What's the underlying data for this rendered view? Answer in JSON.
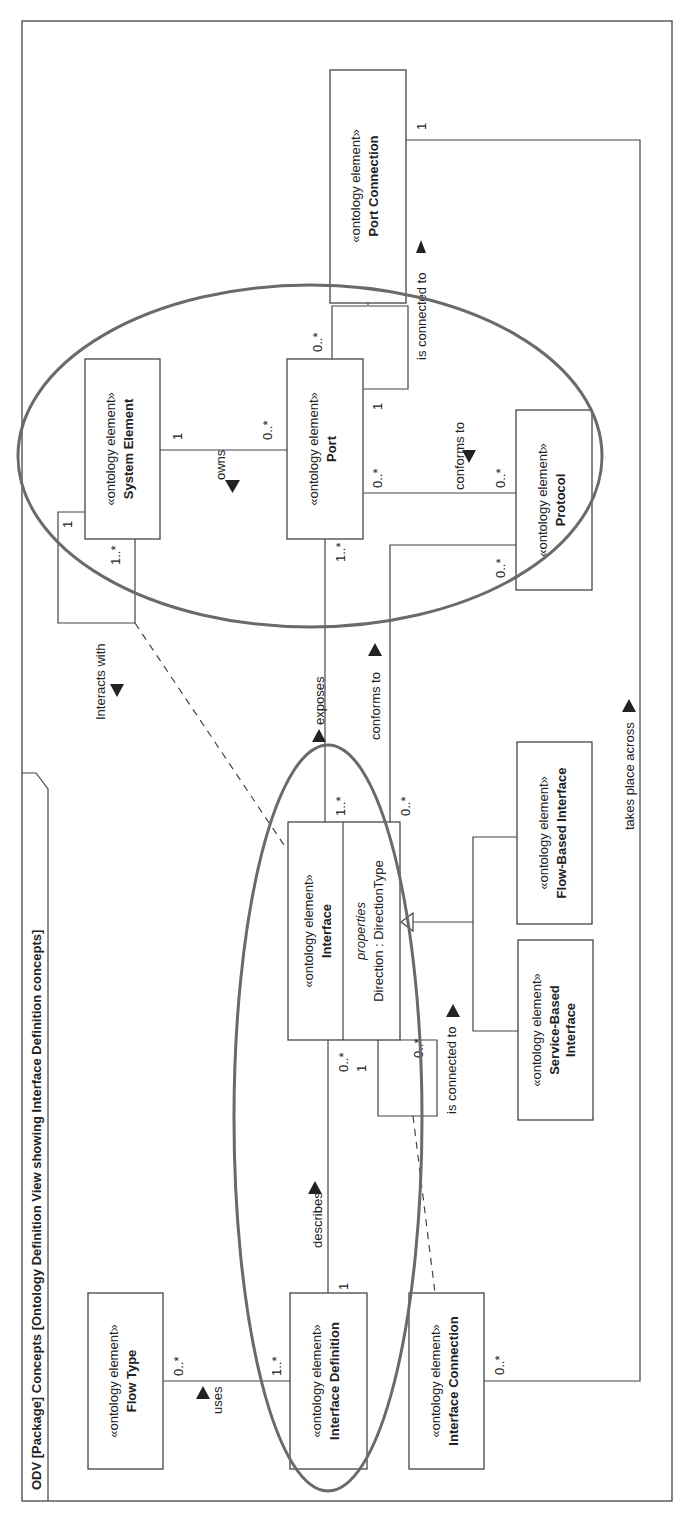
{
  "frame": {
    "title": "ODV [Package] Concepts [Ontology Definition View showing Interface Definition concepts]"
  },
  "stereotype": "«ontology element»",
  "elements": {
    "port_connection": {
      "stereotype": "«ontology element»",
      "name": "Port Connection"
    },
    "system_element": {
      "stereotype": "«ontology element»",
      "name": "System Element"
    },
    "port": {
      "stereotype": "«ontology element»",
      "name": "Port"
    },
    "protocol": {
      "stereotype": "«ontology element»",
      "name": "Protocol"
    },
    "interface": {
      "stereotype": "«ontology element»",
      "name": "Interface",
      "compartment_label": "properties",
      "property": "Direction : DirectionType"
    },
    "flow_based_interface": {
      "stereotype": "«ontology element»",
      "name": "Flow-Based Interface"
    },
    "service_based_interface": {
      "stereotype": "«ontology element»",
      "name_line1": "Service-Based",
      "name_line2": "Interface"
    },
    "flow_type": {
      "stereotype": "«ontology element»",
      "name": "Flow Type"
    },
    "interface_definition": {
      "stereotype": "«ontology element»",
      "name": "Interface Definition"
    },
    "interface_connection": {
      "stereotype": "«ontology element»",
      "name": "Interface Connection"
    }
  },
  "relationships": {
    "port_is_connected_to": {
      "label": "is connected to",
      "mult_port_connection": "1",
      "mult_port_self_top": "0..*",
      "mult_port_self_bottom": "1"
    },
    "owns": {
      "label": "owns",
      "mult_system": "1",
      "mult_port": "0..*"
    },
    "interacts_with": {
      "label": "Interacts with",
      "mult_a": "1",
      "mult_b": "1..*"
    },
    "port_conforms_to": {
      "label": "conforms to",
      "mult_port": "0..*",
      "mult_protocol": "0..*"
    },
    "exposes": {
      "label": "exposes",
      "mult_port": "1..*",
      "mult_interface": "1..*"
    },
    "interface_conforms_to": {
      "label": "conforms to",
      "mult_protocol": "0..*",
      "mult_interface": "0..*"
    },
    "takes_place_across": {
      "label": "takes place across",
      "mult_port_connection": "1",
      "mult_interface_connection": "0..*"
    },
    "describes": {
      "label": "describes",
      "mult_interface": "0..*",
      "mult_definition": "1"
    },
    "interface_is_connected_to": {
      "label": "is connected to",
      "mult_a": "1",
      "mult_b": "0..*"
    },
    "uses": {
      "label": "uses",
      "mult_flow_type": "0..*",
      "mult_definition": "1..*"
    }
  },
  "colors": {
    "line": "#444444",
    "highlight_ellipse": "#6a6a6a",
    "background": "#ffffff"
  }
}
